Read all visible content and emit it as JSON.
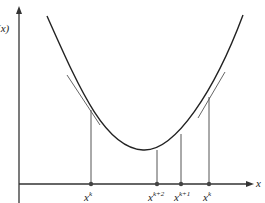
{
  "diagram": {
    "y_axis_label": "f(x)",
    "x_axis_label": "x",
    "curve": "convex parabola with tangent lines",
    "ticks": [
      {
        "base": "x",
        "sup": "k",
        "x": 91,
        "curve_y": 110
      },
      {
        "base": "x",
        "sup": "k+2",
        "x": 157,
        "curve_y": 150
      },
      {
        "base": "x",
        "sup": "k+1",
        "x": 181,
        "curve_y": 134
      },
      {
        "base": "x",
        "sup": "k",
        "x": 209,
        "curve_y": 97
      }
    ],
    "colors": {
      "line": "#222222",
      "tangent": "#555555",
      "vertical": "#666666"
    }
  }
}
